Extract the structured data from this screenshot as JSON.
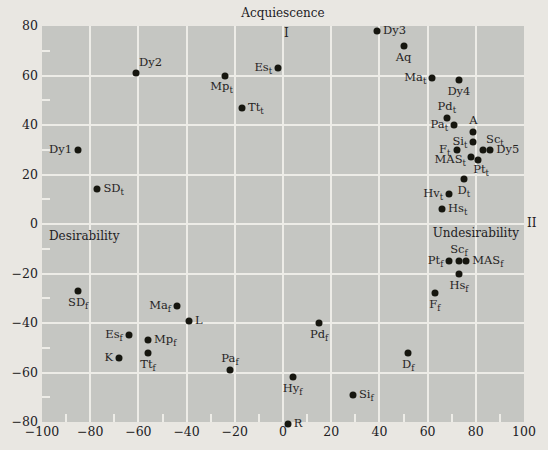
{
  "figure": {
    "background_color": "#e9e7e2",
    "plot_background_color": "#c5c6c2",
    "gridline_color": "#edece7",
    "dot_color": "#16160f",
    "text_color": "#22211f"
  },
  "chart_data": {
    "type": "scatter",
    "title": "",
    "xlim": [
      -100,
      100
    ],
    "ylim": [
      -80,
      80
    ],
    "x_tick_labels": [
      -100,
      -80,
      -60,
      -40,
      -20,
      0,
      20,
      40,
      60,
      80,
      100
    ],
    "y_tick_labels": [
      -80,
      -60,
      -40,
      -20,
      0,
      20,
      40,
      60,
      80
    ],
    "minor_tick_step": 10,
    "grid_step": 20,
    "grid": true,
    "legend": "none",
    "region_labels": {
      "top": "Acquiescence",
      "quadrant_1": "I",
      "quadrant_2": "II",
      "left": "Desirability",
      "right": "Undesirability"
    },
    "points": [
      {
        "base": "Dy1",
        "sub": "",
        "x": -85,
        "y": 30,
        "label_side": "left"
      },
      {
        "base": "SD",
        "sub": "t",
        "x": -77,
        "y": 14,
        "label_side": "right"
      },
      {
        "base": "Dy2",
        "sub": "",
        "x": -61,
        "y": 61,
        "label_side": "above-right"
      },
      {
        "base": "Mp",
        "sub": "t",
        "x": -24,
        "y": 60,
        "label_side": "below-left"
      },
      {
        "base": "Es",
        "sub": "t",
        "x": -2,
        "y": 63,
        "label_side": "left"
      },
      {
        "base": "Tt",
        "sub": "t",
        "x": -17,
        "y": 47,
        "label_side": "right"
      },
      {
        "base": "Dy3",
        "sub": "",
        "x": 39,
        "y": 78,
        "label_side": "right"
      },
      {
        "base": "Aq",
        "sub": "",
        "x": 50,
        "y": 72,
        "label_side": "below"
      },
      {
        "base": "Ma",
        "sub": "t",
        "x": 62,
        "y": 59,
        "label_side": "left"
      },
      {
        "base": "Dy4",
        "sub": "",
        "x": 73,
        "y": 58,
        "label_side": "below"
      },
      {
        "base": "Pd",
        "sub": "t",
        "x": 68,
        "y": 43,
        "label_side": "above"
      },
      {
        "base": "Pa",
        "sub": "t",
        "x": 71,
        "y": 40,
        "label_side": "left"
      },
      {
        "base": "A",
        "sub": "",
        "x": 79,
        "y": 37,
        "label_side": "above"
      },
      {
        "base": "Si",
        "sub": "t",
        "x": 79,
        "y": 33,
        "label_side": "left"
      },
      {
        "base": "Sc",
        "sub": "t",
        "x": 83,
        "y": 30,
        "label_side": "above-right"
      },
      {
        "base": "Dy5",
        "sub": "",
        "x": 86,
        "y": 30,
        "label_side": "right"
      },
      {
        "base": "F",
        "sub": "t",
        "x": 72,
        "y": 30,
        "label_side": "left"
      },
      {
        "base": "MAS",
        "sub": "t",
        "x": 78,
        "y": 27,
        "label_side": "left-below"
      },
      {
        "base": "Pt",
        "sub": "t",
        "x": 81,
        "y": 26,
        "label_side": "below-right"
      },
      {
        "base": "D",
        "sub": "t",
        "x": 75,
        "y": 18,
        "label_side": "below"
      },
      {
        "base": "Hv",
        "sub": "t",
        "x": 69,
        "y": 12,
        "label_side": "left"
      },
      {
        "base": "Hs",
        "sub": "t",
        "x": 66,
        "y": 6,
        "label_side": "right"
      },
      {
        "base": "SD",
        "sub": "f",
        "x": -85,
        "y": -27,
        "label_side": "below"
      },
      {
        "base": "Ma",
        "sub": "f",
        "x": -44,
        "y": -33,
        "label_side": "left"
      },
      {
        "base": "L",
        "sub": "",
        "x": -39,
        "y": -39,
        "label_side": "right"
      },
      {
        "base": "Es",
        "sub": "f",
        "x": -64,
        "y": -45,
        "label_side": "left"
      },
      {
        "base": "Mp",
        "sub": "f",
        "x": -56,
        "y": -47,
        "label_side": "right"
      },
      {
        "base": "Tt",
        "sub": "f",
        "x": -56,
        "y": -52,
        "label_side": "below"
      },
      {
        "base": "K",
        "sub": "",
        "x": -68,
        "y": -54,
        "label_side": "left"
      },
      {
        "base": "Pa",
        "sub": "f",
        "x": -22,
        "y": -59,
        "label_side": "above"
      },
      {
        "base": "Pt",
        "sub": "f",
        "x": 69,
        "y": -15,
        "label_side": "left"
      },
      {
        "base": "Sc",
        "sub": "f",
        "x": 73,
        "y": -15,
        "label_side": "above"
      },
      {
        "base": "MAS",
        "sub": "f",
        "x": 76,
        "y": -15,
        "label_side": "right"
      },
      {
        "base": "Hs",
        "sub": "f",
        "x": 73,
        "y": -20,
        "label_side": "below"
      },
      {
        "base": "F",
        "sub": "f",
        "x": 63,
        "y": -28,
        "label_side": "below"
      },
      {
        "base": "Pd",
        "sub": "f",
        "x": 15,
        "y": -40,
        "label_side": "below"
      },
      {
        "base": "D",
        "sub": "f",
        "x": 52,
        "y": -52,
        "label_side": "below"
      },
      {
        "base": "Hy",
        "sub": "f",
        "x": 4,
        "y": -62,
        "label_side": "below"
      },
      {
        "base": "Si",
        "sub": "f",
        "x": 29,
        "y": -69,
        "label_side": "right"
      },
      {
        "base": "R",
        "sub": "",
        "x": 2,
        "y": -81,
        "label_side": "right"
      }
    ]
  }
}
